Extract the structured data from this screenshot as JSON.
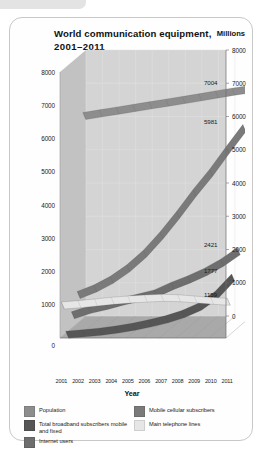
{
  "card": {
    "title_line1": "World communication equipment,",
    "title_line2": "2001–2011",
    "unit_label": "Millions"
  },
  "chart_data": {
    "type": "area",
    "title": "World communication equipment, 2001–2011",
    "subtitle": "",
    "xlabel": "Year",
    "ylabel": "Millions",
    "ylim": [
      0,
      8000
    ],
    "grid": true,
    "legend_position": "bottom",
    "three_d": true,
    "categories": [
      "2001",
      "2002",
      "2003",
      "2004",
      "2005",
      "2006",
      "2007",
      "2008",
      "2009",
      "2010",
      "2011"
    ],
    "x": [
      2001,
      2002,
      2003,
      2004,
      2005,
      2006,
      2007,
      2008,
      2009,
      2010,
      2011
    ],
    "yticks_left": [
      "1000",
      "2000",
      "3000",
      "4000",
      "5000",
      "6000",
      "7000",
      "8000"
    ],
    "yticks_right": [
      "0",
      "1000",
      "2000",
      "3000",
      "4000",
      "5000",
      "6000",
      "7000",
      "8000"
    ],
    "ytick_zero_left": "0",
    "series": [
      {
        "name": "Population",
        "color": "#8d8d8d",
        "end_label": "7004",
        "values": [
          6200,
          6280,
          6360,
          6440,
          6520,
          6600,
          6680,
          6760,
          6850,
          6930,
          7004
        ]
      },
      {
        "name": "Mobile cellular subscribers",
        "color": "#7a7a7a",
        "end_label": "5981",
        "values": [
          961,
          1158,
          1417,
          1763,
          2205,
          2749,
          3368,
          4030,
          4640,
          5320,
          5981
        ]
      },
      {
        "name": "Internet users",
        "color": "#6e6e6e",
        "end_label": "2421",
        "values": [
          495,
          663,
          780,
          913,
          1030,
          1156,
          1380,
          1575,
          1800,
          2080,
          2421
        ]
      },
      {
        "name": "Total broadband subscribers mobile and fixed",
        "color": "#565656",
        "end_label": "1777",
        "values": [
          60,
          100,
          150,
          215,
          295,
          400,
          520,
          680,
          900,
          1250,
          1777
        ]
      },
      {
        "name": "Main telephone lines",
        "color": "#e6e6e6",
        "end_label": "1159",
        "values": [
          1050,
          1090,
          1140,
          1190,
          1230,
          1260,
          1280,
          1270,
          1230,
          1190,
          1159
        ]
      }
    ]
  },
  "legend": {
    "left_column": [
      {
        "label": "Population",
        "color": "#8d8d8d"
      },
      {
        "label": "Total broadband subscribers mobile and fixed",
        "color": "#565656"
      },
      {
        "label": "Internet users",
        "color": "#6e6e6e"
      }
    ],
    "right_column": [
      {
        "label": "Mobile cellular subscribers",
        "color": "#7a7a7a"
      },
      {
        "label": "Main telephone lines",
        "color": "#e6e6e6"
      }
    ]
  }
}
